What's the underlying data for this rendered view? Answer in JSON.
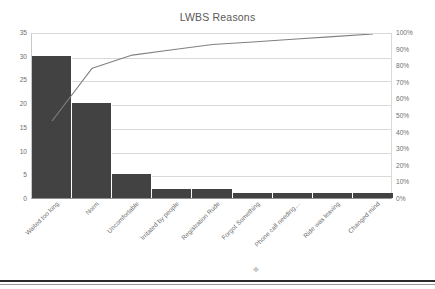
{
  "chart_data": {
    "type": "bar",
    "title": "LWBS Reasons",
    "xlabel": "",
    "ylabel": "",
    "grid": true,
    "legend": "none",
    "categories": [
      "Waited too long",
      "Norm",
      "Uncomfortable",
      "Irritated by people",
      "Registration Rude",
      "Forgot Something",
      "Phone call needing…",
      "Ride was leaving",
      "Changed mind"
    ],
    "series": [
      {
        "name": "Count",
        "type": "bar",
        "axis": "left",
        "values": [
          30,
          20,
          5,
          2,
          2,
          1,
          1,
          1,
          1
        ]
      },
      {
        "name": "Cumulative %",
        "type": "line",
        "axis": "right",
        "values": [
          47.6,
          79.4,
          87.3,
          90.5,
          93.7,
          95.2,
          96.8,
          98.4,
          100.0
        ]
      }
    ],
    "ylim": [
      0,
      35
    ],
    "ylim_right": [
      0,
      100
    ],
    "yticks": [
      "0",
      "5",
      "10",
      "15",
      "20",
      "25",
      "30",
      "35"
    ],
    "yticks_right": [
      "0%",
      "10%",
      "20%",
      "30%",
      "40%",
      "50%",
      "60%",
      "70%",
      "80%",
      "90%",
      "100%"
    ],
    "colors": {
      "bar": "#424242",
      "line": "#808080",
      "grid": "#d9d9d9",
      "text": "#6f6f6f",
      "title": "#595959",
      "background": "#ffffff"
    }
  }
}
